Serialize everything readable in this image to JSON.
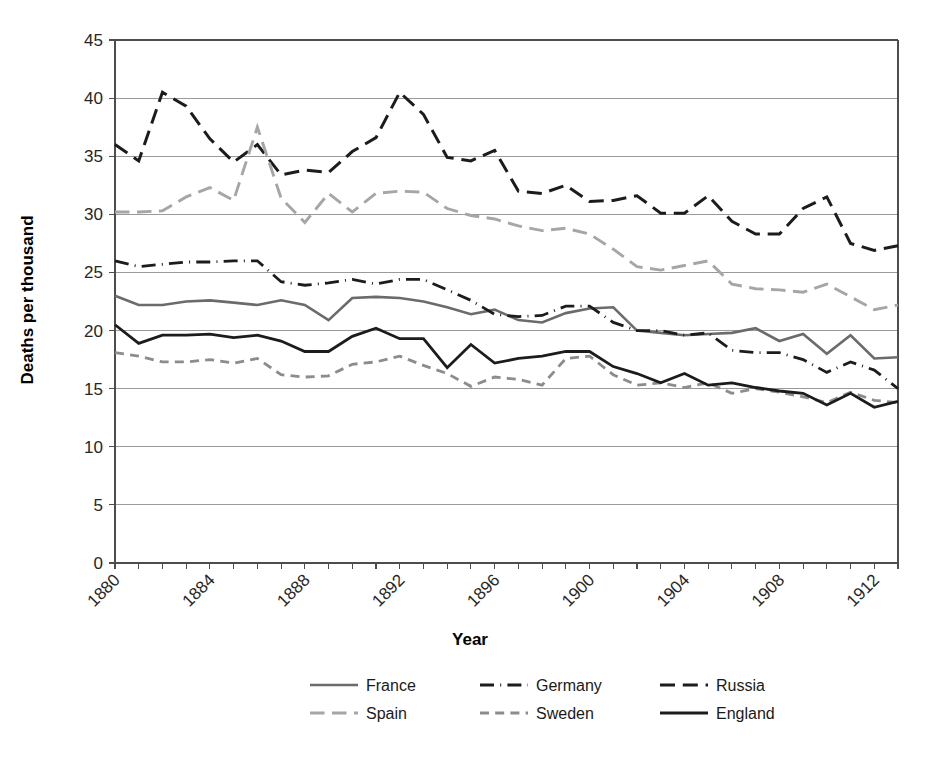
{
  "chart_data": {
    "type": "line",
    "title": "",
    "xlabel": "Year",
    "ylabel": "Deaths per thousand",
    "xlim": [
      1880,
      1913
    ],
    "ylim": [
      0,
      45
    ],
    "ytick_step": 5,
    "yticks": [
      "0",
      "5",
      "10",
      "15",
      "20",
      "25",
      "30",
      "35",
      "40",
      "45"
    ],
    "xticks": [
      "1880",
      "1884",
      "1888",
      "1892",
      "1896",
      "1900",
      "1904",
      "1908",
      "1912"
    ],
    "xtick_step": 4,
    "xtick_rotation": 45,
    "grid": "horizontal",
    "legend_position": "bottom",
    "x": [
      1880,
      1881,
      1882,
      1883,
      1884,
      1885,
      1886,
      1887,
      1888,
      1889,
      1890,
      1891,
      1892,
      1893,
      1894,
      1895,
      1896,
      1897,
      1898,
      1899,
      1900,
      1901,
      1902,
      1903,
      1904,
      1905,
      1906,
      1907,
      1908,
      1909,
      1910,
      1911,
      1912,
      1913
    ],
    "series": [
      {
        "name": "France",
        "color": "#6b6b6b",
        "dash": "none",
        "width": 2.6,
        "values": [
          23.0,
          22.2,
          22.2,
          22.5,
          22.6,
          22.4,
          22.2,
          22.6,
          22.2,
          20.9,
          22.8,
          22.9,
          22.8,
          22.5,
          22.0,
          21.4,
          21.8,
          20.9,
          20.7,
          21.5,
          21.9,
          22.0,
          20.0,
          19.8,
          19.6,
          19.7,
          19.8,
          20.2,
          19.1,
          19.7,
          18.0,
          19.6,
          17.6,
          17.7
        ]
      },
      {
        "name": "Germany",
        "color": "#1c1c1c",
        "dash": "dashdot",
        "width": 2.8,
        "values": [
          26.0,
          25.5,
          25.7,
          25.9,
          25.9,
          26.0,
          26.0,
          24.2,
          23.9,
          24.1,
          24.4,
          24.0,
          24.4,
          24.4,
          23.5,
          22.6,
          21.4,
          21.2,
          21.3,
          22.1,
          22.1,
          20.7,
          20.0,
          20.0,
          19.6,
          19.8,
          18.3,
          18.1,
          18.1,
          17.5,
          16.4,
          17.3,
          16.6,
          15.0
        ]
      },
      {
        "name": "Russia",
        "color": "#1c1c1c",
        "dash": "longdash",
        "width": 3.0,
        "values": [
          36.0,
          34.6,
          40.5,
          39.3,
          36.5,
          34.5,
          36.0,
          33.4,
          33.8,
          33.6,
          35.4,
          36.6,
          40.5,
          38.6,
          34.9,
          34.6,
          35.5,
          32.0,
          31.8,
          32.5,
          31.1,
          31.2,
          31.6,
          30.1,
          30.1,
          31.6,
          29.4,
          28.3,
          28.3,
          30.5,
          31.5,
          27.5,
          26.9,
          27.3
        ]
      },
      {
        "name": "Spain",
        "color": "#a6a6a6",
        "dash": "longdash",
        "width": 2.9,
        "values": [
          30.2,
          30.2,
          30.3,
          31.5,
          32.3,
          31.2,
          37.5,
          31.4,
          29.3,
          31.8,
          30.2,
          31.8,
          32.0,
          31.9,
          30.5,
          29.9,
          29.6,
          29.0,
          28.6,
          28.8,
          28.3,
          27.0,
          25.5,
          25.2,
          25.6,
          26.0,
          24.0,
          23.6,
          23.5,
          23.3,
          24.0,
          22.9,
          21.8,
          22.2
        ]
      },
      {
        "name": "Sweden",
        "color": "#8c8c8c",
        "dash": "dashed",
        "width": 2.8,
        "values": [
          18.1,
          17.8,
          17.3,
          17.3,
          17.5,
          17.2,
          17.6,
          16.2,
          16.0,
          16.1,
          17.1,
          17.3,
          17.8,
          17.0,
          16.3,
          15.2,
          16.0,
          15.8,
          15.3,
          17.6,
          17.8,
          16.2,
          15.3,
          15.5,
          15.1,
          15.5,
          14.6,
          15.0,
          14.7,
          14.3,
          13.8,
          14.7,
          14.0,
          13.8
        ]
      },
      {
        "name": "England",
        "color": "#1c1c1c",
        "dash": "none",
        "width": 2.8,
        "values": [
          20.5,
          18.9,
          19.6,
          19.6,
          19.7,
          19.4,
          19.6,
          19.1,
          18.2,
          18.2,
          19.5,
          20.2,
          19.3,
          19.3,
          16.8,
          18.8,
          17.2,
          17.6,
          17.8,
          18.2,
          18.2,
          16.9,
          16.3,
          15.5,
          16.3,
          15.3,
          15.5,
          15.1,
          14.8,
          14.6,
          13.6,
          14.6,
          13.4,
          13.9
        ]
      }
    ]
  },
  "legend": {
    "entries": [
      {
        "label": "France",
        "color": "#6b6b6b",
        "dash": "none"
      },
      {
        "label": "Germany",
        "color": "#1c1c1c",
        "dash": "dashdot"
      },
      {
        "label": "Russia",
        "color": "#1c1c1c",
        "dash": "longdash"
      },
      {
        "label": "Spain",
        "color": "#a6a6a6",
        "dash": "longdash"
      },
      {
        "label": "Sweden",
        "color": "#8c8c8c",
        "dash": "dashed"
      },
      {
        "label": "England",
        "color": "#1c1c1c",
        "dash": "none"
      }
    ]
  }
}
